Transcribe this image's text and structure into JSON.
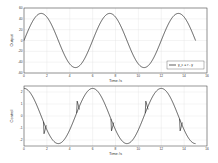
{
  "chart_data": [
    {
      "type": "line",
      "name": "output-plot",
      "title": "",
      "xlabel": "Time /s",
      "ylabel": "Output",
      "xlim": [
        0,
        16
      ],
      "ylim": [
        -60,
        60
      ],
      "xticks": [
        0,
        2,
        4,
        6,
        8,
        10,
        12,
        14,
        16
      ],
      "yticks": [
        60,
        40,
        20,
        0,
        -20,
        -40,
        -60
      ],
      "grid": true,
      "legend": {
        "position": "lower right",
        "entries": [
          "y_c = r - y"
        ]
      },
      "series": [
        {
          "name": "y_c = r - y",
          "description": "sinusoid, amplitude ~50, period ~6 s, starts at 0 rising",
          "x": [
            0,
            1.5,
            3,
            4.5,
            6,
            7.5,
            9,
            10.5,
            12,
            13.5,
            15
          ],
          "y": [
            0,
            50,
            0,
            -50,
            0,
            50,
            0,
            -50,
            0,
            50,
            0
          ]
        }
      ]
    },
    {
      "type": "line",
      "name": "control-plot",
      "title": "",
      "xlabel": "Time /s",
      "ylabel": "Control",
      "xlim": [
        0,
        16
      ],
      "ylim": [
        -2.5,
        2.5
      ],
      "xticks": [
        0,
        2,
        4,
        6,
        8,
        10,
        12,
        14,
        16
      ],
      "yticks": [
        2,
        1,
        0,
        -1,
        -2
      ],
      "grid": true,
      "series": [
        {
          "name": "control",
          "description": "cosine-like, amplitude ~2.3, period ~6 s, with short spikes near t=1.7, 4.6, 7.6, 10.6, 13.6",
          "x": [
            0,
            1.5,
            3,
            4.5,
            6,
            7.5,
            9,
            10.5,
            12,
            13.5,
            15
          ],
          "y": [
            2.3,
            0,
            -2.3,
            0,
            2.3,
            0,
            -2.3,
            0,
            2.3,
            0,
            -2.3
          ],
          "spikes": [
            {
              "t": 1.7,
              "dy": -1.0
            },
            {
              "t": 4.6,
              "dy": 1.0
            },
            {
              "t": 7.6,
              "dy": -1.0
            },
            {
              "t": 10.6,
              "dy": 1.0
            },
            {
              "t": 13.6,
              "dy": -1.0
            }
          ]
        }
      ]
    }
  ]
}
